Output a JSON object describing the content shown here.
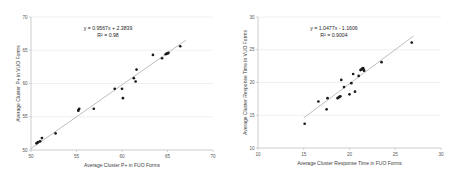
{
  "figure": {
    "background": "#ffffff",
    "point_color": "#1b1b1b",
    "trend_color": "#9a9a9a",
    "grid_color": "#e3e3e3"
  },
  "chart_data": [
    {
      "type": "scatter",
      "title": "",
      "xlabel": "Average Cluster P+ in FUO Forms",
      "ylabel": "Average Cluster P+ in VUO Forms",
      "xlim": [
        50,
        70
      ],
      "ylim": [
        50,
        70
      ],
      "xticks": [
        50,
        55,
        60,
        65,
        70
      ],
      "yticks": [
        50,
        55,
        60,
        65,
        70
      ],
      "grid": true,
      "legend": "none",
      "annotations": {
        "equation": "y = 0.9567x + 2.3839",
        "r_squared": "R² = 0.98",
        "slope": 0.9567,
        "intercept": 2.3839
      },
      "trendline": {
        "x0": 50.0,
        "y0": 50.2,
        "x1": 67.0,
        "y1": 66.5
      },
      "x": [
        50.6,
        50.7,
        50.8,
        51.0,
        51.2,
        52.7,
        55.2,
        55.2,
        55.3,
        56.9,
        59.2,
        60.0,
        60.1,
        61.3,
        61.5,
        61.6,
        63.4,
        64.4,
        64.8,
        64.9,
        65.0,
        65.1,
        66.4
      ],
      "y": [
        51.0,
        51.1,
        51.2,
        51.3,
        51.8,
        52.5,
        55.9,
        56.0,
        56.2,
        56.2,
        59.2,
        59.2,
        57.8,
        60.8,
        60.3,
        62.1,
        64.3,
        63.8,
        64.4,
        64.5,
        64.5,
        64.6,
        65.6
      ]
    },
    {
      "type": "scatter",
      "title": "",
      "xlabel": "Average Cluster Response Time in FUO Forms",
      "ylabel": "Average Cluster Response Time in VUO Forms",
      "xlim": [
        10,
        30
      ],
      "ylim": [
        10,
        30
      ],
      "xticks": [
        10,
        15,
        20,
        25,
        30
      ],
      "yticks": [
        10,
        15,
        20,
        25,
        30
      ],
      "grid": true,
      "legend": "none",
      "annotations": {
        "equation": "y = 1.0477x - 1.1606",
        "r_squared": "R² = 0.9004",
        "slope": 1.0477,
        "intercept": -1.1606
      },
      "trendline": {
        "x0": 15.0,
        "y0": 14.6,
        "x1": 27.0,
        "y1": 27.1
      },
      "x": [
        15.1,
        16.6,
        17.5,
        17.6,
        18.7,
        18.8,
        18.9,
        19.0,
        19.1,
        19.4,
        20.0,
        20.2,
        20.4,
        20.6,
        21.0,
        21.2,
        21.3,
        21.4,
        21.45,
        21.5,
        21.55,
        21.6,
        23.5,
        26.8
      ],
      "y": [
        13.7,
        17.1,
        15.9,
        17.6,
        17.6,
        17.7,
        17.8,
        17.9,
        20.4,
        19.3,
        18.2,
        19.9,
        21.3,
        18.6,
        21.0,
        21.9,
        22.0,
        22.1,
        22.2,
        22.15,
        21.9,
        21.8,
        23.1,
        26.1
      ]
    }
  ]
}
